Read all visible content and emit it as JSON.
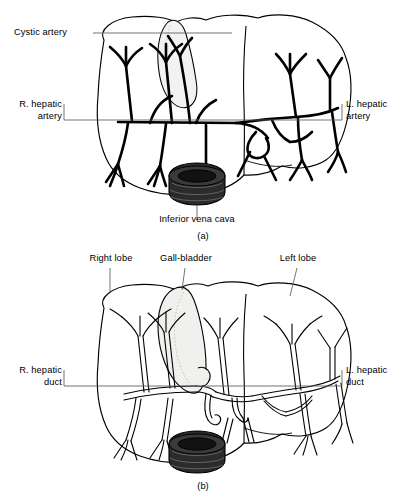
{
  "page": {
    "background_color": "#ffffff",
    "ink_color": "#000000",
    "width": 406,
    "height": 496
  },
  "figure_a": {
    "caption": "(a)",
    "subject": "liver-arterial-supply",
    "labels": {
      "cystic_artery": "Cystic artery",
      "right_hepatic_artery": "R. hepatic\nartery",
      "left_hepatic_artery": "L. hepatic\nartery",
      "inferior_vena_cava": "Inferior vena cava"
    },
    "parts": {
      "liver_outline": "liver-outline",
      "gallbladder": "gallbladder",
      "vena_cava_stump": "inferior-vena-cava-stump",
      "artery_tree": "hepatic-artery-tree"
    },
    "colors": {
      "gallbladder_fill": "#f2f2f0",
      "vena_cava_fill": "#2b2b2b",
      "leader_line": "#5a5a5a"
    }
  },
  "figure_b": {
    "caption": "(b)",
    "subject": "liver-biliary-drainage",
    "labels": {
      "right_lobe": "Right lobe",
      "gall_bladder": "Gall-bladder",
      "left_lobe": "Left lobe",
      "right_hepatic_duct": "R. hepatic\nduct",
      "left_hepatic_duct": "L. hepatic\nduct"
    },
    "parts": {
      "liver_outline": "liver-outline",
      "gallbladder": "gallbladder",
      "vena_cava_stump": "inferior-vena-cava-stump",
      "duct_tree": "bile-duct-tree"
    },
    "colors": {
      "gallbladder_fill": "#f0f0ee",
      "vena_cava_fill": "#2b2b2b",
      "leader_line": "#5a5a5a"
    }
  }
}
